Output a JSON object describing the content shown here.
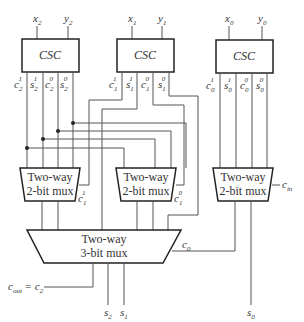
{
  "diagram": {
    "csc_blocks": [
      {
        "label": "CSC",
        "inputs": [
          {
            "base": "x",
            "sub": "2"
          },
          {
            "base": "y",
            "sub": "2"
          }
        ],
        "outputs": [
          {
            "base": "c",
            "sub": "2",
            "sup": "1"
          },
          {
            "base": "s",
            "sub": "2",
            "sup": "1"
          },
          {
            "base": "c",
            "sub": "2",
            "sup": "0"
          },
          {
            "base": "s",
            "sub": "2",
            "sup": "0"
          }
        ]
      },
      {
        "label": "CSC",
        "inputs": [
          {
            "base": "x",
            "sub": "1"
          },
          {
            "base": "y",
            "sub": "1"
          }
        ],
        "outputs": [
          {
            "base": "c",
            "sub": "1",
            "sup": "1"
          },
          {
            "base": "s",
            "sub": "1",
            "sup": "1"
          },
          {
            "base": "c",
            "sub": "1",
            "sup": "0"
          },
          {
            "base": "s",
            "sub": "1",
            "sup": "0"
          }
        ]
      },
      {
        "label": "CSC",
        "inputs": [
          {
            "base": "x",
            "sub": "0"
          },
          {
            "base": "y",
            "sub": "0"
          }
        ],
        "outputs": [
          {
            "base": "c",
            "sub": "0",
            "sup": "1"
          },
          {
            "base": "s",
            "sub": "0",
            "sup": "1"
          },
          {
            "base": "c",
            "sub": "0",
            "sup": "0"
          },
          {
            "base": "s",
            "sub": "0",
            "sup": "0"
          }
        ]
      }
    ],
    "mux2": [
      {
        "line1": "Two-way",
        "line2": "2-bit mux",
        "select": {
          "base": "c",
          "sub": "1",
          "sup": "1"
        }
      },
      {
        "line1": "Two-way",
        "line2": "2-bit mux",
        "select": {
          "base": "c",
          "sub": "1",
          "sup": "0"
        }
      },
      {
        "line1": "Two-way",
        "line2": "2-bit mux",
        "select": {
          "base": "c",
          "sub": "in"
        }
      }
    ],
    "mux3": {
      "line1": "Two-way",
      "line2": "3-bit mux",
      "select": {
        "base": "c",
        "sub": "0"
      }
    },
    "outputs": {
      "cout": {
        "base": "c",
        "sub": "out",
        "eq": " = ",
        "base2": "c",
        "sub2": "2"
      },
      "s2": {
        "base": "s",
        "sub": "2"
      },
      "s1": {
        "base": "s",
        "sub": "1"
      },
      "s0": {
        "base": "s",
        "sub": "0"
      }
    }
  }
}
